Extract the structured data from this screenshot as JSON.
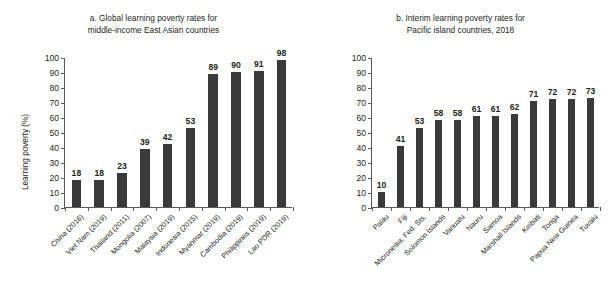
{
  "figure": {
    "background": "#ffffff",
    "bar_color": "#3a3a3a",
    "axis_color": "#58595b",
    "text_color": "#231f20"
  },
  "panels": [
    {
      "id": "a",
      "title_line1": "a. Global learning poverty rates for",
      "title_line2": "middle-income East Asian countries"
    },
    {
      "id": "b",
      "title_line1": "b. Interim learning poverty rates for",
      "title_line2": "Pacific island countries, 2018"
    }
  ],
  "chart_data": [
    {
      "type": "bar",
      "title": "a. Global learning poverty rates for middle-income East Asian countries",
      "xlabel": "",
      "ylabel": "Learning poverty (%)",
      "ylim": [
        0,
        100
      ],
      "yticks": [
        0,
        10,
        20,
        30,
        40,
        50,
        60,
        70,
        80,
        90,
        100
      ],
      "ytick_labels": [
        "0",
        "10",
        "20",
        "30",
        "40",
        "50",
        "60",
        "70",
        "80",
        "90",
        "100"
      ],
      "grid": false,
      "legend": null,
      "data_labels": true,
      "categories": [
        "China (2016)",
        "Viet Nam (2019)",
        "Thailand (2011)",
        "Mongolia (2007)",
        "Malaysia (2019)",
        "Indonesia (2015)",
        "Myanmar (2019)",
        "Cambodia (2019)",
        "Philippines (2019)",
        "Lao PDR (2019)"
      ],
      "values": [
        18,
        18,
        23,
        39,
        42,
        53,
        89,
        90,
        91,
        98
      ]
    },
    {
      "type": "bar",
      "title": "b. Interim learning poverty rates for Pacific island countries, 2018",
      "xlabel": "",
      "ylabel": "Interim learning poverty (%)",
      "ylim": [
        0,
        100
      ],
      "yticks": [
        0,
        10,
        20,
        30,
        40,
        50,
        60,
        70,
        80,
        90,
        100
      ],
      "ytick_labels": [
        "0",
        "10",
        "20",
        "30",
        "40",
        "50",
        "60",
        "70",
        "80",
        "90",
        "100"
      ],
      "grid": false,
      "legend": null,
      "data_labels": true,
      "categories": [
        "Palau",
        "Fiji",
        "Micronesia, Fed. Sts.",
        "Solomon Islands",
        "Vanuatu",
        "Nauru",
        "Samoa",
        "Marshall Islands",
        "Kiribati",
        "Tonga",
        "Papua New Guinea",
        "Tuvalu"
      ],
      "values": [
        10,
        41,
        53,
        58,
        58,
        61,
        61,
        62,
        71,
        72,
        72,
        73
      ]
    }
  ]
}
